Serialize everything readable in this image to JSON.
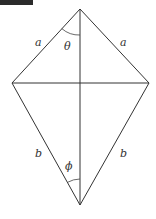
{
  "figure": {
    "type": "kite",
    "colors": {
      "stroke": "#333333",
      "background": "#ffffff",
      "corner_tab": "#2b2b2b"
    },
    "vertices": {
      "top": [
        80,
        9
      ],
      "left": [
        12,
        83
      ],
      "right": [
        149,
        83
      ],
      "bottom": [
        80,
        205
      ]
    },
    "labels": {
      "upper_left_side": "a",
      "upper_right_side": "a",
      "lower_left_side": "b",
      "lower_right_side": "b",
      "top_angle": "θ",
      "bottom_angle": "ϕ"
    }
  }
}
